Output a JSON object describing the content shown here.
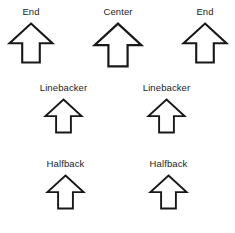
{
  "diagram": {
    "background_color": "#ffffff",
    "stroke_color": "#18181a",
    "label_color": "#1c1c1c",
    "arrow_icon_name": "up-arrow-outline-icon",
    "rows": [
      {
        "name": "line-row",
        "players": [
          {
            "label": "End",
            "position": "left-end",
            "x": 8,
            "y": 6,
            "arrow_width": 46,
            "arrow_height": 42,
            "stroke_width": 2.1,
            "label_offset_x": 0
          },
          {
            "label": "Center",
            "position": "center",
            "x": 93,
            "y": 6,
            "arrow_width": 50,
            "arrow_height": 46,
            "stroke_width": 2.2,
            "label_offset_x": 0
          },
          {
            "label": "End",
            "position": "right-end",
            "x": 182,
            "y": 6,
            "arrow_width": 46,
            "arrow_height": 42,
            "stroke_width": 2.1,
            "label_offset_x": 0
          }
        ]
      },
      {
        "name": "linebacker-row",
        "players": [
          {
            "label": "Linebacker",
            "position": "left-linebacker",
            "x": 44,
            "y": 82,
            "arrow_width": 39,
            "arrow_height": 36,
            "stroke_width": 1.9,
            "label_offset_x": 0
          },
          {
            "label": "Linebacker",
            "position": "right-linebacker",
            "x": 147,
            "y": 82,
            "arrow_width": 39,
            "arrow_height": 36,
            "stroke_width": 1.9,
            "label_offset_x": 0
          }
        ]
      },
      {
        "name": "halfback-row",
        "players": [
          {
            "label": "Halfback",
            "position": "left-halfback",
            "x": 46,
            "y": 158,
            "arrow_width": 39,
            "arrow_height": 36,
            "stroke_width": 1.9,
            "label_offset_x": 0
          },
          {
            "label": "Halfback",
            "position": "right-halfback",
            "x": 149,
            "y": 158,
            "arrow_width": 39,
            "arrow_height": 36,
            "stroke_width": 1.9,
            "label_offset_x": 0
          }
        ]
      }
    ]
  }
}
